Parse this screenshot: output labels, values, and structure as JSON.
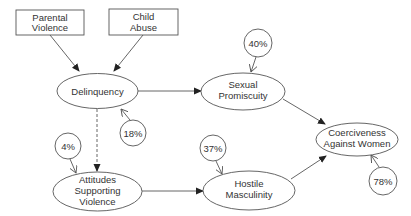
{
  "diagram": {
    "type": "path-model",
    "colors": {
      "stroke": "#555555",
      "text": "#333333",
      "background": "#ffffff"
    },
    "nodes": {
      "parental_violence": {
        "shape": "rect",
        "lines": [
          "Parental",
          "Violence"
        ]
      },
      "child_abuse": {
        "shape": "rect",
        "lines": [
          "Child",
          "Abuse"
        ]
      },
      "delinquency": {
        "shape": "ellipse",
        "lines": [
          "Delinquency"
        ]
      },
      "sexual_promiscuity": {
        "shape": "ellipse",
        "lines": [
          "Sexual",
          "Promiscuity"
        ]
      },
      "attitudes_supporting_violence": {
        "shape": "ellipse",
        "lines": [
          "Attitudes",
          "Supporting",
          "Violence"
        ]
      },
      "hostile_masculinity": {
        "shape": "ellipse",
        "lines": [
          "Hostile",
          "Masculinity"
        ]
      },
      "coerciveness_against_women": {
        "shape": "ellipse",
        "lines": [
          "Coerciveness",
          "Against Women"
        ]
      }
    },
    "residuals": {
      "delinquency": "18%",
      "sexual_promiscuity": "40%",
      "attitudes_supporting_violence": "4%",
      "hostile_masculinity": "37%",
      "coerciveness_against_women": "78%"
    },
    "edges": [
      {
        "from": "Parental Violence",
        "to": "Delinquency",
        "style": "solid"
      },
      {
        "from": "Child Abuse",
        "to": "Delinquency",
        "style": "solid"
      },
      {
        "from": "Delinquency",
        "to": "Sexual Promiscuity",
        "style": "solid"
      },
      {
        "from": "Delinquency",
        "to": "Attitudes Supporting Violence",
        "style": "dashed"
      },
      {
        "from": "Sexual Promiscuity",
        "to": "Coerciveness Against Women",
        "style": "solid"
      },
      {
        "from": "Attitudes Supporting Violence",
        "to": "Hostile Masculinity",
        "style": "solid"
      },
      {
        "from": "Hostile Masculinity",
        "to": "Coerciveness Against Women",
        "style": "solid"
      }
    ]
  }
}
